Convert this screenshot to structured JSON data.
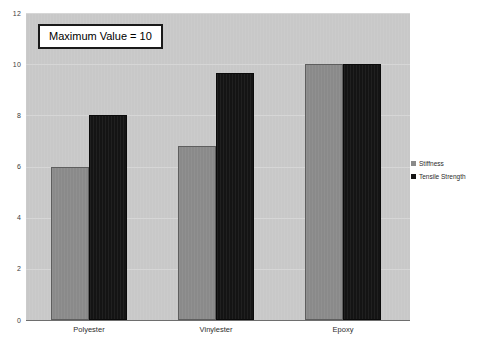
{
  "chart_data": {
    "type": "bar",
    "title": "",
    "xlabel": "",
    "ylabel": "",
    "categories": [
      "Polyester",
      "Vinylester",
      "Epoxy"
    ],
    "series": [
      {
        "name": "Stiffness",
        "color": "#8a8a8a",
        "values": [
          6.0,
          6.8,
          10.0
        ]
      },
      {
        "name": "Tensile Strength",
        "color": "#141414",
        "values": [
          8.0,
          9.65,
          10.0
        ]
      }
    ],
    "ylim": [
      0,
      12
    ],
    "yticks": [
      0,
      2,
      4,
      6,
      8,
      10,
      12
    ],
    "ytick_labels": [
      "0",
      "2",
      "4",
      "6",
      "8",
      "10",
      "12"
    ],
    "grid": true,
    "legend_position": "right-outside",
    "plot_background": "#c8c8c8",
    "figure_background": "#ffffff",
    "annotations": [
      {
        "text": "Maximum Value = 10"
      }
    ]
  }
}
